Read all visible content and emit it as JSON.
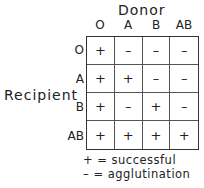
{
  "title": "Donor",
  "row_axis_title": "Recipient",
  "donor_types": [
    "O",
    "A",
    "B",
    "AB"
  ],
  "recipient_types": [
    "O",
    "A",
    "B",
    "AB"
  ],
  "matrix": [
    [
      "+",
      "–",
      "–",
      "–"
    ],
    [
      "+",
      "+",
      "–",
      "–"
    ],
    [
      "+",
      "–",
      "+",
      "–"
    ],
    [
      "+",
      "+",
      "+",
      "+"
    ]
  ],
  "legend": {
    "plus": "+ = successful",
    "minus": "– = agglutination"
  }
}
